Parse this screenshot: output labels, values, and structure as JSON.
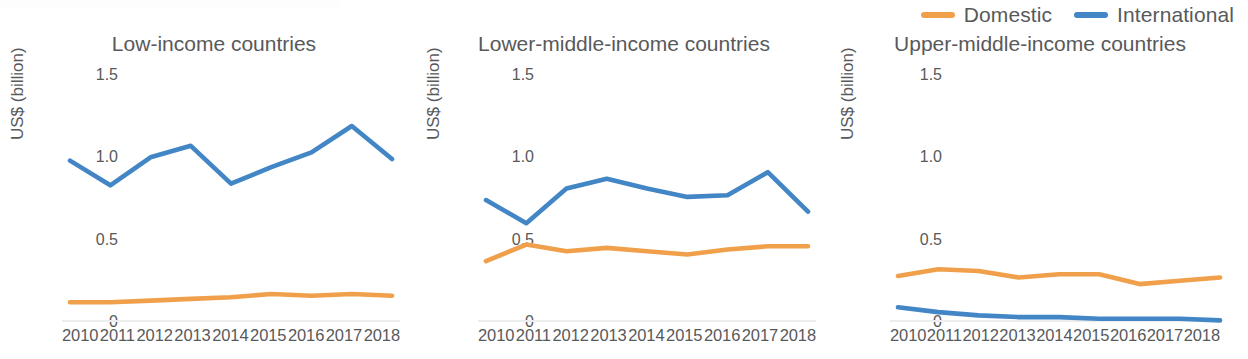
{
  "legend": {
    "items": [
      {
        "label": "Domestic",
        "color": "#f0a04b",
        "icon": "line-swatch-icon"
      },
      {
        "label": "International",
        "color": "#4286c6",
        "icon": "line-swatch-icon"
      }
    ]
  },
  "axis": {
    "ylabel": "US$ (billion)",
    "yticks": [
      "1.5",
      "1.0",
      "0.5",
      "0"
    ],
    "xticks": [
      "2010",
      "2011",
      "2012",
      "2013",
      "2014",
      "2015",
      "2016",
      "2017",
      "2018"
    ]
  },
  "chart_data": [
    {
      "type": "line",
      "title": "Low-income countries",
      "xlabel": "",
      "ylabel": "US$ (billion)",
      "x": [
        2010,
        2011,
        2012,
        2013,
        2014,
        2015,
        2016,
        2017,
        2018
      ],
      "ylim": [
        0,
        1.5
      ],
      "yticks": [
        0,
        0.5,
        1.0,
        1.5
      ],
      "grid": false,
      "legend_position": "top-right",
      "series": [
        {
          "name": "Domestic",
          "color": "#f0a04b",
          "values": [
            0.12,
            0.12,
            0.13,
            0.14,
            0.15,
            0.17,
            0.16,
            0.17,
            0.16
          ]
        },
        {
          "name": "International",
          "color": "#4286c6",
          "values": [
            0.98,
            0.83,
            1.0,
            1.07,
            0.84,
            0.94,
            1.03,
            1.19,
            0.99
          ]
        }
      ]
    },
    {
      "type": "line",
      "title": "Lower-middle-income countries",
      "xlabel": "",
      "ylabel": "US$ (billion)",
      "x": [
        2010,
        2011,
        2012,
        2013,
        2014,
        2015,
        2016,
        2017,
        2018
      ],
      "ylim": [
        0,
        1.5
      ],
      "yticks": [
        0,
        0.5,
        1.0,
        1.5
      ],
      "grid": false,
      "legend_position": "top-right",
      "series": [
        {
          "name": "Domestic",
          "color": "#f0a04b",
          "values": [
            0.37,
            0.47,
            0.43,
            0.45,
            0.43,
            0.41,
            0.44,
            0.46,
            0.46
          ]
        },
        {
          "name": "International",
          "color": "#4286c6",
          "values": [
            0.74,
            0.6,
            0.81,
            0.87,
            0.81,
            0.76,
            0.77,
            0.91,
            0.67
          ]
        }
      ]
    },
    {
      "type": "line",
      "title": "Upper-middle-income countries",
      "xlabel": "",
      "ylabel": "US$ (billion)",
      "x": [
        2010,
        2011,
        2012,
        2013,
        2014,
        2015,
        2016,
        2017,
        2018
      ],
      "ylim": [
        0,
        1.5
      ],
      "yticks": [
        0,
        0.5,
        1.0,
        1.5
      ],
      "grid": false,
      "legend_position": "top-right",
      "series": [
        {
          "name": "Domestic",
          "color": "#f0a04b",
          "values": [
            0.28,
            0.32,
            0.31,
            0.27,
            0.29,
            0.29,
            0.23,
            0.25,
            0.27
          ]
        },
        {
          "name": "International",
          "color": "#4286c6",
          "values": [
            0.09,
            0.06,
            0.04,
            0.03,
            0.03,
            0.02,
            0.02,
            0.02,
            0.01
          ]
        }
      ]
    }
  ]
}
